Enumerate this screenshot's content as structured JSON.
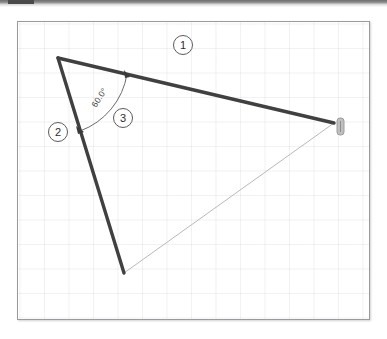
{
  "window": {
    "titlebar_present": true,
    "titlebar_color": "#6e6e6e"
  },
  "canvas": {
    "name": "sketch-canvas",
    "background": "#ffffff",
    "grid_visible": true,
    "grid_color": "#b6bdcb",
    "grid_spacing_px": 24.5,
    "border_color": "#9a9a9a"
  },
  "sketch": {
    "type": "triangle",
    "constrained_color": "#404040",
    "construction_color": "#b9b9b9",
    "vertices": {
      "top_left": {
        "x": 40,
        "y": 36
      },
      "right": {
        "x": 316,
        "y": 101
      },
      "bottom": {
        "x": 106,
        "y": 251
      }
    },
    "edges": [
      {
        "id": "1",
        "label": "1",
        "name": "edge-1",
        "style": "thick",
        "from": "top_left",
        "to": "right",
        "color": "#404040",
        "width": 3.4
      },
      {
        "id": "2",
        "label": "2",
        "name": "edge-2",
        "style": "thick",
        "from": "top_left",
        "to": "bottom",
        "color": "#404040",
        "width": 3.4
      },
      {
        "id": "3",
        "label": "3",
        "name": "edge-3-closing",
        "style": "thin",
        "from": "bottom",
        "to": "right",
        "color": "#b9b9b9",
        "width": 1
      }
    ],
    "angle_dimension": {
      "name": "angle-dimension",
      "value_text": "60.0°",
      "value": 60.0,
      "unit": "degrees",
      "at_vertex": "top_left",
      "between_edges": [
        "1",
        "2"
      ],
      "arc_color": "#555555",
      "text_rotation_deg": -58
    },
    "labels": [
      {
        "id": "1",
        "text": "1",
        "name": "edge-label-1",
        "cx": 165,
        "cy": 23
      },
      {
        "id": "2",
        "text": "2",
        "name": "edge-label-2",
        "cx": 40,
        "cy": 110
      },
      {
        "id": "3",
        "text": "3",
        "name": "edge-label-3",
        "cx": 105,
        "cy": 96
      }
    ],
    "handle": {
      "name": "drag-handle",
      "label": "",
      "x": 319,
      "y": 96,
      "width": 7,
      "height": 17,
      "color": "#a8a8a8"
    }
  }
}
